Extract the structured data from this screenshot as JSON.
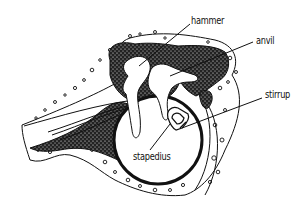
{
  "diagram": {
    "style": "black and white pen illustration",
    "colors": {
      "ink": "#111111",
      "background": "#ffffff",
      "stipple": "#2a2a2a"
    },
    "labels": [
      {
        "id": "hammer",
        "text": "hammer",
        "x": 191,
        "y": 16,
        "pointer": [
          [
            190,
            24
          ],
          [
            139,
            66
          ]
        ]
      },
      {
        "id": "anvil",
        "text": "anvil",
        "x": 256,
        "y": 36,
        "pointer": [
          [
            253,
            42
          ],
          [
            170,
            76
          ]
        ]
      },
      {
        "id": "stirrup",
        "text": "stirrup",
        "x": 265,
        "y": 90,
        "pointer": [
          [
            262,
            98
          ],
          [
            182,
            128
          ]
        ]
      },
      {
        "id": "stapedius",
        "text": "stapedius",
        "x": 133,
        "y": 152,
        "pointer": [
          [
            150,
            150
          ],
          [
            170,
            124
          ]
        ]
      }
    ]
  }
}
